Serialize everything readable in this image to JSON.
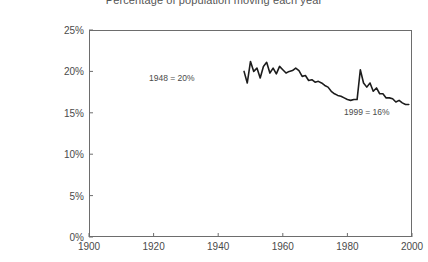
{
  "chart_data": {
    "type": "line",
    "title": "Percentage of population moving each year",
    "xlabel": "",
    "ylabel": "",
    "xlim": [
      1900,
      2000
    ],
    "ylim": [
      0,
      25
    ],
    "x_ticks": [
      "1900",
      "1920",
      "1940",
      "1960",
      "1980",
      "2000"
    ],
    "x_tick_values": [
      1900,
      1920,
      1940,
      1960,
      1980,
      2000
    ],
    "y_ticks": [
      "0%",
      "5%",
      "10%",
      "15%",
      "20%",
      "25%"
    ],
    "y_tick_values": [
      0,
      5,
      10,
      15,
      20,
      25
    ],
    "grid": false,
    "legend": null,
    "line_color": "#1c1c1c",
    "axis_color": "#6d6d6d",
    "annotations": [
      {
        "text": "1948  =  20%",
        "x": 1948,
        "y": 20
      },
      {
        "text": "1999  =  16%",
        "x": 1999,
        "y": 16
      }
    ],
    "series": [
      {
        "name": "Percentage of population moving each year",
        "x": [
          1948,
          1949,
          1950,
          1951,
          1952,
          1953,
          1954,
          1955,
          1956,
          1957,
          1958,
          1959,
          1960,
          1961,
          1962,
          1963,
          1964,
          1965,
          1966,
          1967,
          1968,
          1969,
          1970,
          1971,
          1972,
          1973,
          1974,
          1975,
          1976,
          1977,
          1978,
          1979,
          1980,
          1981,
          1982,
          1983,
          1984,
          1985,
          1986,
          1987,
          1988,
          1989,
          1990,
          1991,
          1992,
          1993,
          1994,
          1995,
          1996,
          1997,
          1998,
          1999
        ],
        "values": [
          20.0,
          18.6,
          21.2,
          20.0,
          20.4,
          19.2,
          20.6,
          21.1,
          19.8,
          20.4,
          19.7,
          20.6,
          20.2,
          19.8,
          20.0,
          20.1,
          20.4,
          20.1,
          19.4,
          19.5,
          18.9,
          19.0,
          18.7,
          18.8,
          18.6,
          18.3,
          18.1,
          17.6,
          17.3,
          17.1,
          17.0,
          16.8,
          16.6,
          16.5,
          16.6,
          16.6,
          20.2,
          18.6,
          18.1,
          18.6,
          17.6,
          18.0,
          17.3,
          17.3,
          16.8,
          16.8,
          16.7,
          16.3,
          16.5,
          16.2,
          16.0,
          16.0
        ]
      }
    ]
  },
  "y_axis": {
    "labels": [
      "25%",
      "20%",
      "15%",
      "10%",
      "5%",
      "0%"
    ]
  },
  "x_axis": {
    "labels": [
      "1900",
      "1920",
      "1940",
      "1960",
      "1980",
      "2000"
    ]
  },
  "annotations": {
    "first": "1948  =  20%",
    "second": "1999  =  16%"
  }
}
